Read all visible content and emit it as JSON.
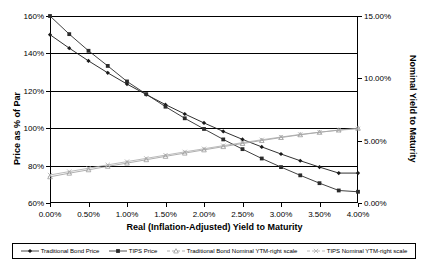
{
  "chart_data": {
    "type": "line",
    "title": "",
    "xlabel": "Real (Inflation-Adjusted) Yield to Maturity",
    "ylabel": "Price as % of Par",
    "ylabel_right": "Nominal Yield to Maturity",
    "x": [
      0.0,
      0.25,
      0.5,
      0.75,
      1.0,
      1.25,
      1.5,
      1.75,
      2.0,
      2.25,
      2.5,
      2.75,
      3.0,
      3.25,
      3.5,
      3.75,
      4.0
    ],
    "x_tick_labels": [
      "0.00%",
      "0.50%",
      "1.00%",
      "1.50%",
      "2.00%",
      "2.50%",
      "3.00%",
      "3.50%",
      "4.00%"
    ],
    "x_tick_values": [
      0.0,
      0.5,
      1.0,
      1.5,
      2.0,
      2.5,
      3.0,
      3.5,
      4.0
    ],
    "xlim": [
      0.0,
      4.0
    ],
    "y_left_tick_labels": [
      "60%",
      "80%",
      "100%",
      "120%",
      "140%",
      "160%"
    ],
    "y_left_tick_values": [
      60,
      80,
      100,
      120,
      140,
      160
    ],
    "ylim_left": [
      60,
      160
    ],
    "y_right_tick_labels": [
      "0.00%",
      "5.00%",
      "10.00%",
      "15.00%"
    ],
    "y_right_tick_values": [
      0,
      5,
      10,
      15
    ],
    "ylim_right": [
      0,
      15
    ],
    "grid": true,
    "legend_position": "bottom",
    "series": [
      {
        "name": "Traditional  Bond Price",
        "axis": "left",
        "marker": "diamond",
        "color": "#1a1a1a",
        "values": [
          150.0,
          142.8,
          136.0,
          129.6,
          123.6,
          118.0,
          112.6,
          107.6,
          102.8,
          98.3,
          94.0,
          90.0,
          86.2,
          82.6,
          79.2,
          76.0,
          76.0
        ]
      },
      {
        "name": "TIPS Price",
        "axis": "left",
        "marker": "square",
        "color": "#2b2b2b",
        "values": [
          160.0,
          150.3,
          141.4,
          133.3,
          125.0,
          118.2,
          111.5,
          105.3,
          99.6,
          94.0,
          88.8,
          83.8,
          79.2,
          74.8,
          70.6,
          66.7,
          66.0
        ]
      },
      {
        "name": "Traditional Bond Nominal YTM-right scale",
        "axis": "right",
        "marker": "triangle",
        "color": "#9a9a9a",
        "values": [
          2.1,
          2.39,
          2.66,
          2.94,
          3.2,
          3.47,
          3.74,
          4.0,
          4.26,
          4.52,
          4.77,
          5.01,
          5.25,
          5.47,
          5.67,
          5.85,
          6.0
        ]
      },
      {
        "name": "TIPS Nominal YTM-right scale",
        "axis": "right",
        "marker": "asterisk",
        "color": "#a8a8a8",
        "values": [
          2.25,
          2.52,
          2.79,
          3.06,
          3.32,
          3.58,
          3.84,
          4.1,
          4.35,
          4.6,
          4.84,
          5.07,
          5.29,
          5.5,
          5.68,
          5.84,
          5.95
        ]
      }
    ]
  },
  "legend": {
    "items": [
      {
        "label": "Traditional  Bond Price",
        "marker": "diamond",
        "color": "#1a1a1a"
      },
      {
        "label": "TIPS Price",
        "marker": "square",
        "color": "#2b2b2b"
      },
      {
        "label": "Traditional Bond Nominal YTM-right scale",
        "marker": "triangle",
        "color": "#9a9a9a"
      },
      {
        "label": "TIPS Nominal YTM-right scale",
        "marker": "asterisk",
        "color": "#a8a8a8"
      }
    ]
  }
}
